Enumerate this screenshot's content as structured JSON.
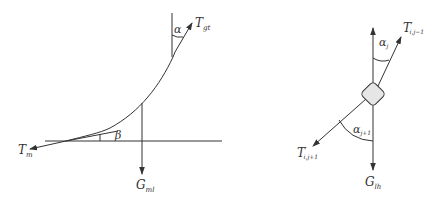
{
  "left_diagram": {
    "labels": {
      "T_top": {
        "main": "T",
        "sub": "gt"
      },
      "T_bottom": {
        "main": "T",
        "sub": "m"
      },
      "G": {
        "main": "G",
        "sub": "ml"
      },
      "alpha": "α",
      "beta": "β"
    }
  },
  "right_diagram": {
    "labels": {
      "T_upper": {
        "main": "T",
        "prime": "′",
        "sub": "i,j−1"
      },
      "T_lower": {
        "main": "T",
        "prime": "′",
        "sub": "i,j+1"
      },
      "G": {
        "main": "G",
        "sub": "lh"
      },
      "alpha_upper": {
        "main": "α",
        "sub": "j"
      },
      "alpha_lower": {
        "main": "α",
        "sub": "j+1"
      }
    }
  },
  "colors": {
    "stroke": "#333333",
    "node_fill": "#e6e6e6"
  }
}
